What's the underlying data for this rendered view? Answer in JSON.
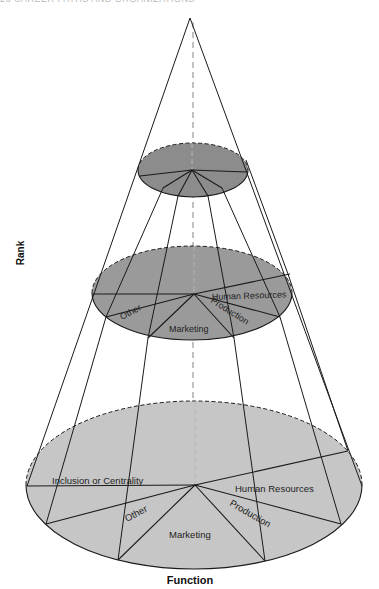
{
  "header": {
    "text": "26   CAREER PATHS AND ORGANIZATIONS"
  },
  "colors": {
    "top_fill": "#8c8c8c",
    "middle_fill": "#9a9a9a",
    "bottom_fill": "#c6c6c6",
    "stroke": "#1a1a1a",
    "axis_dash": "#999999"
  },
  "axes": {
    "vertical_label": "Rank",
    "horizontal_label": "Function"
  },
  "cone": {
    "apex": [
      190,
      18
    ],
    "axis_line": {
      "x": 193,
      "y1": 22,
      "y2": 486
    },
    "edges": [
      {
        "from": [
          190,
          18
        ],
        "to": [
          27,
          486
        ]
      },
      {
        "from": [
          190,
          18
        ],
        "to": [
          362,
          486
        ]
      }
    ],
    "inner_lines": [
      {
        "points": [
          [
            163,
            188
          ],
          [
            106,
            317
          ],
          [
            46,
            524
          ]
        ]
      },
      {
        "points": [
          [
            178,
            196
          ],
          [
            148,
            338
          ],
          [
            118,
            560
          ]
        ]
      },
      {
        "points": [
          [
            208,
            196
          ],
          [
            234,
            338
          ],
          [
            265,
            561
          ]
        ]
      },
      {
        "points": [
          [
            222,
            188
          ],
          [
            280,
            317
          ],
          [
            341,
            524
          ]
        ]
      },
      {
        "points": [
          [
            246,
            160
          ],
          [
            288,
            274
          ],
          [
            348,
            451
          ]
        ]
      }
    ]
  },
  "levels": [
    {
      "name": "top",
      "cx": 193,
      "cy": 170,
      "rx": 55,
      "ry": 27,
      "hub": [
        192,
        170
      ],
      "radials": [
        [
          140,
          176
        ],
        [
          163,
          188
        ],
        [
          178,
          196
        ],
        [
          208,
          196
        ],
        [
          222,
          188
        ],
        [
          246,
          172
        ]
      ],
      "labels": []
    },
    {
      "name": "middle",
      "cx": 192,
      "cy": 293,
      "rx": 100,
      "ry": 47,
      "hub": [
        194,
        294
      ],
      "radials": [
        [
          93,
          294
        ],
        [
          106,
          317
        ],
        [
          148,
          338
        ],
        [
          234,
          338
        ],
        [
          280,
          317
        ],
        [
          290,
          274
        ]
      ],
      "labels": [
        {
          "text": "Other",
          "x": 122,
          "y": 320,
          "size": 9,
          "rotate": -28
        },
        {
          "text": "Marketing",
          "x": 169,
          "y": 332,
          "size": 9,
          "rotate": 0
        },
        {
          "text": "Production",
          "x": 210,
          "y": 302,
          "size": 9,
          "rotate": 32
        },
        {
          "text": "Human Resources",
          "x": 212,
          "y": 300,
          "size": 9,
          "rotate": -2
        }
      ]
    },
    {
      "name": "bottom",
      "cx": 194,
      "cy": 485,
      "rx": 168,
      "ry": 84,
      "hub": [
        195,
        485
      ],
      "radials": [
        [
          27,
          486
        ],
        [
          46,
          524
        ],
        [
          118,
          560
        ],
        [
          265,
          561
        ],
        [
          341,
          524
        ],
        [
          348,
          451
        ]
      ],
      "labels": [
        {
          "text": "Inclusion or Centrality",
          "x": 52,
          "y": 484,
          "size": 9.5,
          "rotate": 0
        },
        {
          "text": "Other",
          "x": 127,
          "y": 522,
          "size": 9.5,
          "rotate": -28
        },
        {
          "text": "Marketing",
          "x": 169,
          "y": 538,
          "size": 9.5,
          "rotate": 0
        },
        {
          "text": "Production",
          "x": 229,
          "y": 505,
          "size": 9.5,
          "rotate": 30
        },
        {
          "text": "Human Resources",
          "x": 235,
          "y": 492,
          "size": 9.5,
          "rotate": 0
        }
      ]
    }
  ]
}
